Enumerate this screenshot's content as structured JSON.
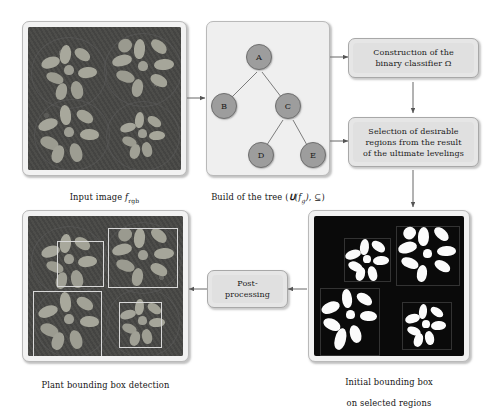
{
  "diagram": {
    "background_color": "#ffffff",
    "panel_fill": "#f2f2f2",
    "procbox_fill": "#e6e6e6",
    "node_fill": "#9d9d9d",
    "arrow_color": "#555555"
  },
  "nodes": {
    "input_image": {
      "caption_pre": "Input image ",
      "caption_math": "f",
      "caption_sub": "rgb",
      "caption_full": "Input image f_rgb",
      "kind": "photograph",
      "description": "top-down RGB photo of four Arabidopsis rosette plants in trays"
    },
    "tree": {
      "caption_pre": "Build of the tree (",
      "caption_math": "U(f_g), ⊆",
      "caption_post": ")",
      "caption_full": "Build of the tree (U(f_g), ⊆)",
      "kind": "tree-graph",
      "tree_nodes": [
        {
          "id": "A",
          "label": "A"
        },
        {
          "id": "B",
          "label": "B"
        },
        {
          "id": "C",
          "label": "C"
        },
        {
          "id": "D",
          "label": "D"
        },
        {
          "id": "E",
          "label": "E"
        }
      ],
      "tree_edges": [
        {
          "from": "A",
          "to": "B"
        },
        {
          "from": "A",
          "to": "C"
        },
        {
          "from": "C",
          "to": "D"
        },
        {
          "from": "C",
          "to": "E"
        }
      ]
    },
    "classifier_box": {
      "label": "Construction of the\nbinary classifier Ω",
      "line1": "Construction of the",
      "line2": "binary classifier Ω"
    },
    "selection_box": {
      "label": "Selection of desirable\nregions from the result\nof the ultimate levelings",
      "line1": "Selection of desirable",
      "line2": "regions from the result",
      "line3": "of the ultimate levelings"
    },
    "initial_bbox_image": {
      "caption_line1": "Initial bounding box",
      "caption_line2": "on selected regions",
      "caption_full": "Initial bounding box on selected regions",
      "kind": "binary-segmentation",
      "description": "black background with four white segmented plant rosettes and faint bounding boxes"
    },
    "postprocessing_box": {
      "label": "Post-\nprocessing",
      "line1": "Post-",
      "line2": "processing"
    },
    "final_image": {
      "caption_full": "Plant bounding box detection",
      "kind": "photograph-with-boxes",
      "description": "original RGB photo overlaid with four white rectangular bounding boxes",
      "box_count": 4
    }
  },
  "flow": [
    {
      "from": "input_image",
      "to": "tree",
      "direction": "right"
    },
    {
      "from": "tree",
      "to": "classifier_box",
      "direction": "right"
    },
    {
      "from": "classifier_box",
      "to": "selection_box",
      "direction": "down"
    },
    {
      "from": "tree",
      "to": "selection_box",
      "direction": "right"
    },
    {
      "from": "selection_box",
      "to": "initial_bbox_image",
      "direction": "down"
    },
    {
      "from": "initial_bbox_image",
      "to": "postprocessing_box",
      "direction": "left"
    },
    {
      "from": "postprocessing_box",
      "to": "final_image",
      "direction": "left"
    }
  ]
}
